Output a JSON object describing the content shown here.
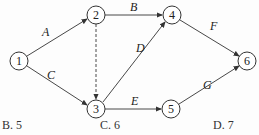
{
  "diagram": {
    "nodes": [
      {
        "id": "1",
        "label": "1",
        "x": 19,
        "y": 61
      },
      {
        "id": "2",
        "label": "2",
        "x": 96,
        "y": 15
      },
      {
        "id": "3",
        "label": "3",
        "x": 96,
        "y": 109
      },
      {
        "id": "4",
        "label": "4",
        "x": 172,
        "y": 15
      },
      {
        "id": "5",
        "label": "5",
        "x": 171,
        "y": 109
      },
      {
        "id": "6",
        "label": "6",
        "x": 247,
        "y": 61
      }
    ],
    "edges": [
      {
        "from": "1",
        "to": "2",
        "label": "A",
        "dashed": false
      },
      {
        "from": "1",
        "to": "3",
        "label": "C",
        "dashed": false
      },
      {
        "from": "2",
        "to": "4",
        "label": "B",
        "dashed": false
      },
      {
        "from": "2",
        "to": "3",
        "label": "",
        "dashed": true
      },
      {
        "from": "3",
        "to": "4",
        "label": "D",
        "dashed": false
      },
      {
        "from": "3",
        "to": "5",
        "label": "E",
        "dashed": false
      },
      {
        "from": "4",
        "to": "6",
        "label": "F",
        "dashed": false
      },
      {
        "from": "5",
        "to": "6",
        "label": "G",
        "dashed": false
      }
    ]
  },
  "options": [
    {
      "label": "B. 5"
    },
    {
      "label": "C. 6"
    },
    {
      "label": "D. 7"
    }
  ]
}
